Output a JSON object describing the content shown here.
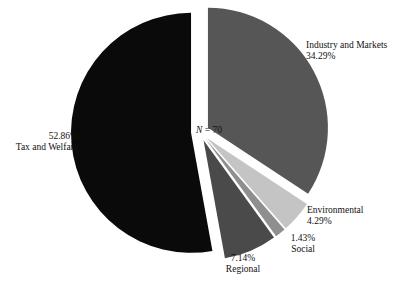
{
  "chart_data": {
    "type": "pie",
    "title": "",
    "subtitle": "",
    "xlabel": "",
    "ylabel": "",
    "grid": false,
    "legend_position": "none",
    "annotation": {
      "n_symbol": "N",
      "n_text": " = 70",
      "full": "N = 70",
      "value": 70
    },
    "total_n": 70,
    "exploded": true,
    "start_angle_deg": 0,
    "direction": "clockwise",
    "categories": [
      "Industry and Markets",
      "Environmental",
      "Social",
      "Regional",
      "Tax and Welfare"
    ],
    "values": [
      34.29,
      4.29,
      1.43,
      7.14,
      52.86
    ],
    "value_labels": [
      "34.29%",
      "4.29%",
      "1.43%",
      "7.14%",
      "52.86%"
    ],
    "counts": [
      24,
      3,
      1,
      5,
      37
    ],
    "colors": [
      "#565656",
      "#c4c4c4",
      "#8f8f8f",
      "#4a4a4a",
      "#0a0a0a"
    ],
    "slices": [
      {
        "name": "Industry and Markets",
        "percent_label": "34.29%",
        "value": 34.29,
        "color": "#565656",
        "label_align": "left"
      },
      {
        "name": "Environmental",
        "percent_label": "4.29%",
        "value": 4.29,
        "color": "#c4c4c4",
        "label_align": "left"
      },
      {
        "name": "Social",
        "percent_label": "1.43%",
        "value": 1.43,
        "color": "#8f8f8f",
        "label_align": "center"
      },
      {
        "name": "Regional",
        "percent_label": "7.14%",
        "value": 7.14,
        "color": "#4a4a4a",
        "label_align": "center"
      },
      {
        "name": "Tax and Welfare",
        "percent_label": "52.86%",
        "value": 52.86,
        "color": "#0a0a0a",
        "label_align": "right"
      }
    ],
    "background_color": "#ffffff",
    "text_color": "#111111"
  }
}
